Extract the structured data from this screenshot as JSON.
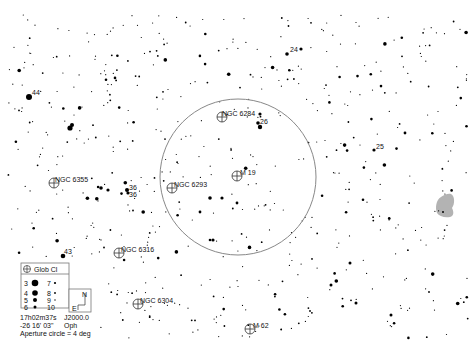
{
  "chart_data": {
    "type": "scatter",
    "center": {
      "ra": "17h02m37s",
      "dec": "-26 16' 03\""
    },
    "epoch": "J2000.0",
    "constellation": "Oph",
    "aperture_label": "Aperture circle = 4 deg",
    "aperture_deg": 4,
    "legend": {
      "object_type": "Glob Cl",
      "magnitudes": [
        "3",
        "4",
        "5",
        "6",
        "7",
        "8",
        "9",
        "10"
      ],
      "compass": {
        "north": "N",
        "east": "E"
      }
    },
    "objects": [
      {
        "name": "NGC 6284",
        "type": "globular-cluster"
      },
      {
        "name": "M 19",
        "type": "globular-cluster"
      },
      {
        "name": "NGC 6293",
        "type": "globular-cluster"
      },
      {
        "name": "NGC 6355",
        "type": "globular-cluster"
      },
      {
        "name": "NGC 6316",
        "type": "globular-cluster"
      },
      {
        "name": "NGC 6304",
        "type": "globular-cluster"
      },
      {
        "name": "M 62",
        "type": "globular-cluster"
      }
    ],
    "star_labels": [
      "24",
      "26",
      "25",
      "44",
      "36",
      "36",
      "43"
    ],
    "galaxy_patch": {
      "present": true,
      "color": "#b0b0b0"
    }
  }
}
